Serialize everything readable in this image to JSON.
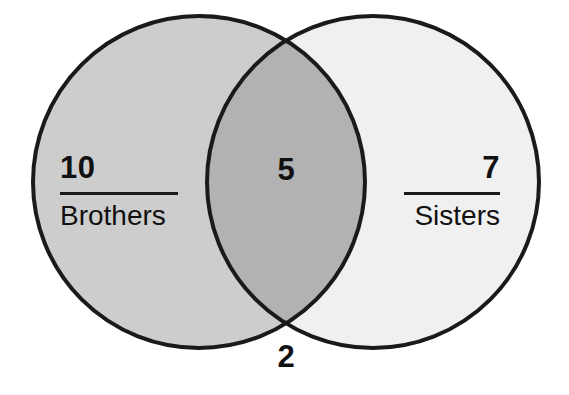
{
  "diagram": {
    "type": "venn",
    "title": "",
    "sets": [
      {
        "id": "left",
        "label": "Brothers",
        "count": "10",
        "fill": "#cdcdcd",
        "center_x": 199,
        "center_y": 182,
        "radius": 166
      },
      {
        "id": "right",
        "label": "Sisters",
        "count": "7",
        "fill": "#f0f0f0",
        "center_x": 373,
        "center_y": 182,
        "radius": 166
      }
    ],
    "intersection": {
      "count": "5",
      "fill": "#b2b2b2"
    },
    "outside": {
      "count": "2"
    },
    "stroke_color": "#1a1a1a",
    "stroke_width": 4,
    "background": "#ffffff"
  }
}
